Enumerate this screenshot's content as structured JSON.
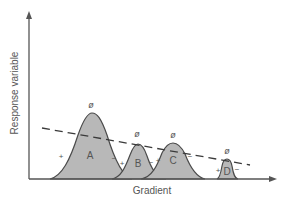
{
  "diagram": {
    "x_axis_label": "Gradient",
    "y_axis_label": "Response variable",
    "colors": {
      "axis": "#555555",
      "curve_fill": "#b8b8b8",
      "curve_stroke": "#4a4a4a",
      "dashed_line": "#3a3a3a",
      "text": "#555555"
    },
    "curves": [
      {
        "id": "A",
        "label": "A",
        "top_symbol": "ø",
        "plus": "+",
        "minus": "−"
      },
      {
        "id": "B",
        "label": "B",
        "top_symbol": "ø",
        "plus": "+",
        "minus": "−"
      },
      {
        "id": "C",
        "label": "C",
        "top_symbol": "ø",
        "plus": "+",
        "minus": "−"
      },
      {
        "id": "D",
        "label": "D",
        "top_symbol": "ø",
        "plus": "+",
        "minus": "−"
      }
    ],
    "trend_line": {
      "style": "dashed",
      "description": "declining linear trend across gradient"
    }
  }
}
